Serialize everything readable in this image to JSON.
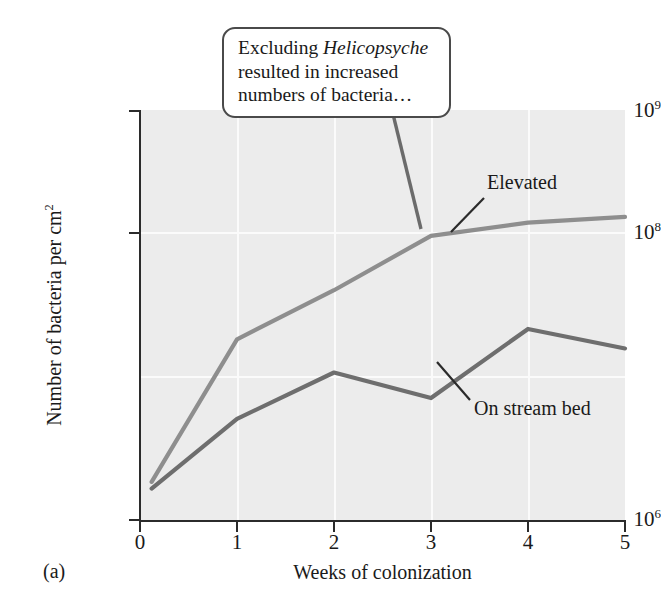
{
  "figure": {
    "panel_label": "(a)",
    "callout": {
      "line1_pre": "Excluding ",
      "line1_em": "Helicopsyche",
      "line2": "resulted in increased",
      "line3": "numbers of bacteria…"
    }
  },
  "chart_data": {
    "type": "line",
    "title": "",
    "xlabel": "Weeks of colonization",
    "ylabel": "Number of bacteria per cm²",
    "ylabel_parts": {
      "text": "Number of bacteria per cm",
      "sup": "2"
    },
    "yscale": "log",
    "ylim": [
      1000000,
      1000000000
    ],
    "xlim": [
      0,
      5
    ],
    "grid": true,
    "legend_position": "inline-annotation",
    "x_tick_labels": [
      "0",
      "1",
      "2",
      "3",
      "4",
      "5"
    ],
    "x_tick_values": [
      0,
      1,
      2,
      3,
      4,
      5
    ],
    "y_tick_labels": [
      "10⁶",
      "10⁸",
      "10⁹"
    ],
    "y_tick_parts": [
      {
        "base": "10",
        "exp": "6"
      },
      {
        "base": "10",
        "exp": "8"
      },
      {
        "base": "10",
        "exp": "9"
      }
    ],
    "y_tick_values": [
      1000000,
      100000000,
      1000000000
    ],
    "x": [
      0.12,
      1,
      2,
      3,
      4,
      5
    ],
    "series": [
      {
        "name": "Elevated",
        "color": "#8e8e8e",
        "values": [
          1900000,
          21000000,
          48000000,
          120000000,
          150000000,
          165000000
        ]
      },
      {
        "name": "On stream bed",
        "color": "#6e6e6e",
        "values": [
          1700000,
          5500000,
          12000000,
          7800000,
          25000000,
          18000000
        ]
      }
    ],
    "annotations": [
      {
        "text": "Excluding Helicopsyche resulted in increased numbers of bacteria…",
        "target_series": "Elevated",
        "target_x": 3
      },
      {
        "text": "Elevated",
        "target_series": "Elevated",
        "target_x": 3.55
      },
      {
        "text": "On stream bed",
        "target_series": "On stream bed",
        "target_x": 3.35
      }
    ]
  },
  "colors": {
    "plot_background": "#ececec",
    "gridline": "#fbfbfb",
    "axis": "#2b2b2b",
    "callout_border": "#4a4a4a",
    "elevated": "#8e8e8e",
    "stream_bed": "#6e6e6e"
  }
}
